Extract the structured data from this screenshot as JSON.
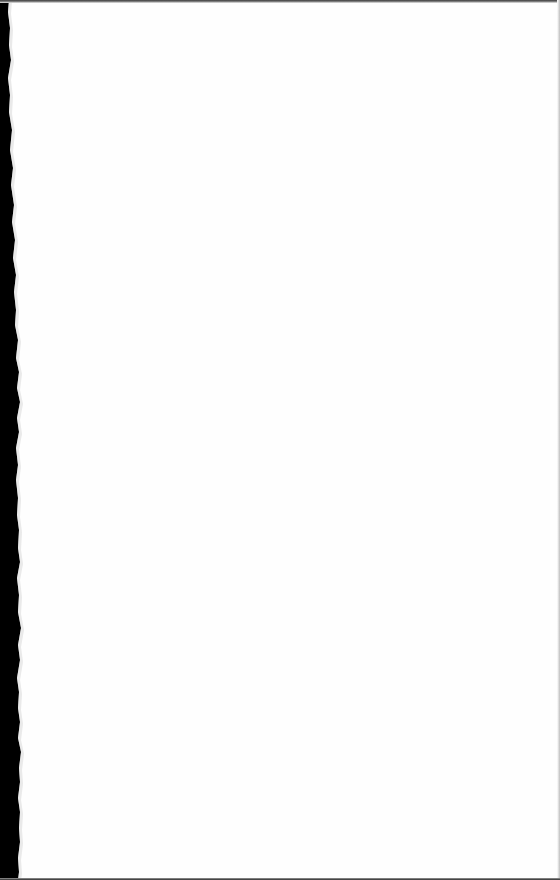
{
  "page": {
    "type": "scanned-blank-page",
    "text_content": "",
    "colors": {
      "paper": "#fefefe",
      "torn_edge": "#000000",
      "top_border": "#3a3a3a",
      "right_border": "#bdbdbd",
      "bottom_border": "#2a2a2a"
    }
  }
}
